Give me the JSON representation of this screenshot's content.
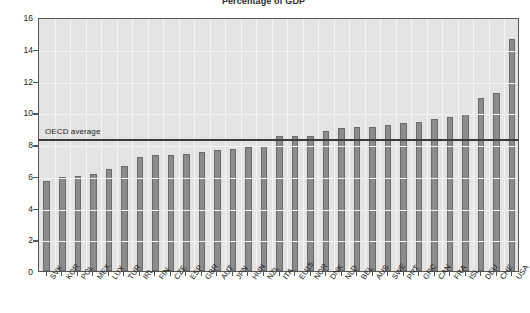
{
  "chart_data": {
    "type": "bar",
    "title": "Percentage of GDP",
    "xlabel": "",
    "ylabel": "",
    "ylim": [
      0,
      16
    ],
    "yticks": [
      0,
      2,
      4,
      6,
      8,
      10,
      12,
      14,
      16
    ],
    "grid": true,
    "legend": "none",
    "categories": [
      "SVK",
      "KOR",
      "POL",
      "MEX",
      "LUX",
      "TUR",
      "IRL",
      "FIN",
      "CZE",
      "ESP",
      "GBR",
      "AUT",
      "JPN",
      "HUN",
      "NZL",
      "ITA",
      "EU15",
      "NOR",
      "DNK",
      "NLD",
      "BEL",
      "AUS",
      "SWE",
      "PRT",
      "GRC",
      "CAN",
      "FRA",
      "ISL",
      "DEU",
      "CHE",
      "USA"
    ],
    "values": [
      5.7,
      5.9,
      6.0,
      6.1,
      6.4,
      6.6,
      7.2,
      7.3,
      7.3,
      7.4,
      7.5,
      7.6,
      7.7,
      7.8,
      7.9,
      8.5,
      8.5,
      8.5,
      8.8,
      9.0,
      9.1,
      9.1,
      9.2,
      9.3,
      9.4,
      9.6,
      9.7,
      9.9,
      10.9,
      11.2,
      14.6
    ],
    "annotations": [
      {
        "label": "OECD average",
        "value": 8.4,
        "type": "hline"
      }
    ]
  }
}
